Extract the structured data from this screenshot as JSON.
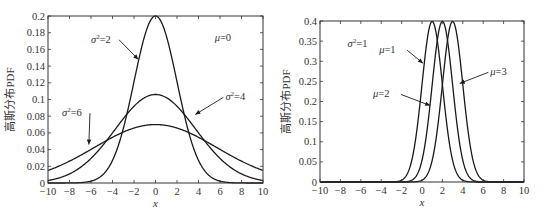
{
  "chart_data": [
    {
      "type": "line",
      "title": "",
      "xlabel": "x",
      "ylabel": "高斯分布PDF",
      "xlim": [
        -10,
        10
      ],
      "ylim": [
        0,
        0.2
      ],
      "xticks": [
        -10,
        -8,
        -6,
        -4,
        -2,
        0,
        2,
        4,
        6,
        8,
        10
      ],
      "xtick_labels": [
        "−10",
        "−8",
        "−6",
        "−4",
        "−2",
        "0",
        "2",
        "4",
        "6",
        "8",
        "10"
      ],
      "yticks": [
        0,
        0.02,
        0.04,
        0.06,
        0.08,
        0.1,
        0.12,
        0.14,
        0.16,
        0.18,
        0.2
      ],
      "ytick_labels": [
        "0",
        "0.02",
        "0.04",
        "0.06",
        "0.08",
        "0.1",
        "0.12",
        "0.14",
        "0.16",
        "0.18",
        "0.2"
      ],
      "grid": false,
      "legend": null,
      "annotations": [
        {
          "text": "μ=0",
          "x": 5.5,
          "y": 0.17
        },
        {
          "text": "σ²=2",
          "x": -6.0,
          "y": 0.168,
          "arrow_to": [
            -1.6,
            0.148
          ]
        },
        {
          "text": "σ²=4",
          "x": 6.5,
          "y": 0.099,
          "arrow_to": [
            3.7,
            0.082
          ]
        },
        {
          "text": "σ²=6",
          "x": -8.7,
          "y": 0.08,
          "arrow_to": [
            -6.2,
            0.046
          ]
        }
      ],
      "series": [
        {
          "name": "σ²=2",
          "mu": 0,
          "std": 2,
          "peak": 0.2
        },
        {
          "name": "σ²=4",
          "mu": 0,
          "std": 3.75,
          "peak": 0.106
        },
        {
          "name": "σ²=6",
          "mu": 0,
          "std": 5.7,
          "peak": 0.07
        }
      ]
    },
    {
      "type": "line",
      "title": "",
      "xlabel": "x",
      "ylabel": "高斯分布PDF",
      "xlim": [
        -10,
        10
      ],
      "ylim": [
        0,
        0.4
      ],
      "xticks": [
        -10,
        -8,
        -6,
        -4,
        -2,
        0,
        2,
        4,
        6,
        8,
        10
      ],
      "xtick_labels": [
        "−10",
        "−8",
        "−6",
        "−4",
        "−2",
        "0",
        "2",
        "4",
        "6",
        "8",
        "10"
      ],
      "yticks": [
        0,
        0.05,
        0.1,
        0.15,
        0.2,
        0.25,
        0.3,
        0.35,
        0.4
      ],
      "ytick_labels": [
        "0",
        "0.05",
        "0.1",
        "0.15",
        "0.2",
        "0.25",
        "0.3",
        "0.35",
        "0.4"
      ],
      "grid": false,
      "legend": null,
      "annotations": [
        {
          "text": "σ²=1",
          "x": -7.3,
          "y": 0.335
        },
        {
          "text": "μ=1",
          "x": -4.2,
          "y": 0.32,
          "arrow_to": [
            0.1,
            0.295
          ]
        },
        {
          "text": "μ=2",
          "x": -4.8,
          "y": 0.21,
          "arrow_to": [
            0.8,
            0.19
          ]
        },
        {
          "text": "μ=3",
          "x": 6.7,
          "y": 0.265,
          "arrow_to": [
            3.7,
            0.245
          ]
        }
      ],
      "series": [
        {
          "name": "μ=1",
          "mu": 1,
          "std": 1,
          "peak": 0.3989
        },
        {
          "name": "μ=2",
          "mu": 2,
          "std": 1,
          "peak": 0.3989
        },
        {
          "name": "μ=3",
          "mu": 3,
          "std": 1,
          "peak": 0.3989
        }
      ]
    }
  ],
  "plots": [
    {
      "box": {
        "x0": 48,
        "y0": 16,
        "x1": 263,
        "y1": 183
      }
    },
    {
      "box": {
        "x0": 320,
        "y0": 21,
        "x1": 524,
        "y1": 182
      }
    }
  ],
  "colors": {
    "line": "#1a1a1a",
    "axis": "#333333",
    "text": "#333333"
  }
}
